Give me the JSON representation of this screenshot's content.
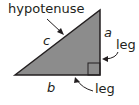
{
  "diagram": {
    "labels": {
      "hypotenuse": "hypotenuse",
      "side_c": "c",
      "side_a": "a",
      "side_b": "b",
      "leg_vertical": "leg",
      "leg_horizontal": "leg"
    },
    "colors": {
      "triangle_fill": "#8c8c8c",
      "stroke": "#231f20",
      "background": "#ffffff"
    }
  }
}
